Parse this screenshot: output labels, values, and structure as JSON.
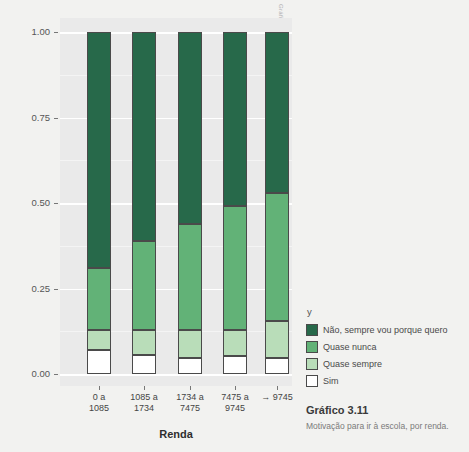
{
  "credit": "Gráfico: OAE",
  "axes": {
    "y_title": "População",
    "x_title": "Renda",
    "y_ticks": [
      "1.00",
      "0.75",
      "0.50",
      "0.25",
      "0.00"
    ],
    "x_tick_labels": [
      "0 a\n1085",
      "1085 a\n1734",
      "1734 a\n7475",
      "7475 a\n9745",
      "→ 9745"
    ]
  },
  "legend": {
    "title": "y",
    "items": [
      {
        "label": "Não, sempre vou porque quero",
        "color": "#27694a"
      },
      {
        "label": "Quase nunca",
        "color": "#62b277"
      },
      {
        "label": "Quase sempre",
        "color": "#b9ddb9"
      },
      {
        "label": "Sim",
        "color": "#ffffff"
      }
    ]
  },
  "caption": {
    "title": "Gráfico 3.11",
    "subtitle": "Motivação para ir à escola, por renda."
  },
  "chart_data": {
    "type": "bar",
    "stacked": true,
    "title": "Gráfico 3.11",
    "subtitle": "Motivação para ir à escola, por renda.",
    "xlabel": "Renda",
    "ylabel": "População",
    "ylim": [
      0,
      1
    ],
    "yticks": [
      0,
      0.25,
      0.5,
      0.75,
      1
    ],
    "grid": true,
    "legend_position": "right",
    "legend_title": "y",
    "categories": [
      "0 a 1085",
      "1085 a 1734",
      "1734 a 7475",
      "7475 a 9745",
      "→ 9745"
    ],
    "series": [
      {
        "name": "Sim",
        "color": "#ffffff",
        "values": [
          0.07,
          0.056,
          0.047,
          0.053,
          0.047
        ]
      },
      {
        "name": "Quase sempre",
        "color": "#b9ddb9",
        "values": [
          0.06,
          0.072,
          0.082,
          0.077,
          0.108
        ]
      },
      {
        "name": "Quase nunca",
        "color": "#62b277",
        "values": [
          0.18,
          0.262,
          0.311,
          0.36,
          0.375
        ]
      },
      {
        "name": "Não, sempre vou porque quero",
        "color": "#27694a",
        "values": [
          0.69,
          0.61,
          0.56,
          0.51,
          0.47
        ]
      }
    ],
    "cumulative_tops": {
      "Sim": [
        0.07,
        0.056,
        0.047,
        0.053,
        0.047
      ],
      "Quase sempre": [
        0.13,
        0.128,
        0.129,
        0.13,
        0.155
      ],
      "Quase nunca": [
        0.31,
        0.39,
        0.44,
        0.49,
        0.53
      ],
      "Não, sempre vou porque quero": [
        1.0,
        1.0,
        1.0,
        1.0,
        1.0
      ]
    }
  }
}
